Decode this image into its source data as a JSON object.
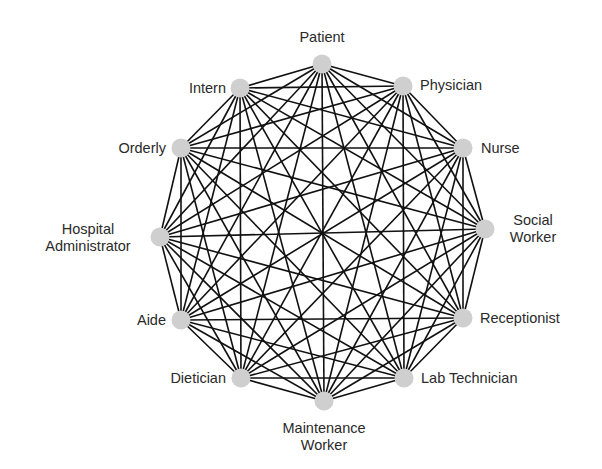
{
  "diagram": {
    "type": "complete-graph",
    "node_color": "#cfcfcf",
    "edge_color": "#111111",
    "nodes": [
      {
        "id": "patient",
        "label": "Patient",
        "x": 322,
        "y": 64
      },
      {
        "id": "physician",
        "label": "Physician",
        "x": 403,
        "y": 86
      },
      {
        "id": "nurse",
        "label": "Nurse",
        "x": 463,
        "y": 148
      },
      {
        "id": "social",
        "label": "Social Worker",
        "line1": "Social",
        "line2": "Worker",
        "x": 485,
        "y": 229
      },
      {
        "id": "receptionist",
        "label": "Receptionist",
        "x": 463,
        "y": 318
      },
      {
        "id": "labtech",
        "label": "Lab Technician",
        "x": 404,
        "y": 378
      },
      {
        "id": "maintenance",
        "label": "Maintenance Worker",
        "line1": "Maintenance",
        "line2": "Worker",
        "x": 324,
        "y": 401
      },
      {
        "id": "dietician",
        "label": "Dietician",
        "x": 241,
        "y": 378
      },
      {
        "id": "aide",
        "label": "Aide",
        "x": 181,
        "y": 320
      },
      {
        "id": "hospadmin",
        "label": "Hospital Administrator",
        "line1": "Hospital",
        "line2": "Administrator",
        "x": 160,
        "y": 237
      },
      {
        "id": "orderly",
        "label": "Orderly",
        "x": 181,
        "y": 148
      },
      {
        "id": "intern",
        "label": "Intern",
        "x": 240,
        "y": 88
      }
    ]
  }
}
